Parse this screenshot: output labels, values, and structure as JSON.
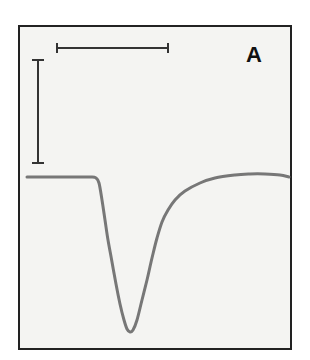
{
  "figure": {
    "panel_label": "A",
    "colors": {
      "background": "#f4f4f2",
      "frame": "#222222",
      "trace": "#777777",
      "scale_bar": "#333333"
    },
    "frame": {
      "x": 19,
      "y": 26,
      "width": 272,
      "height": 323
    },
    "scale_bars": {
      "horizontal": {
        "x1": 57,
        "x2": 168,
        "y": 48
      },
      "vertical": {
        "x": 38,
        "y1": 60,
        "y2": 163
      }
    }
  },
  "chart_data": {
    "type": "line",
    "title": "",
    "xlabel": "",
    "ylabel": "",
    "grid": false,
    "legend": null,
    "annotations": [
      "A"
    ],
    "series": [
      {
        "name": "trace",
        "points_px": [
          [
            27,
            177
          ],
          [
            60,
            177
          ],
          [
            90,
            177
          ],
          [
            96,
            178
          ],
          [
            99,
            183
          ],
          [
            102,
            200
          ],
          [
            105,
            220
          ],
          [
            108,
            240
          ],
          [
            112,
            262
          ],
          [
            116,
            284
          ],
          [
            120,
            304
          ],
          [
            124,
            320
          ],
          [
            127,
            329
          ],
          [
            130,
            332
          ],
          [
            133,
            330
          ],
          [
            137,
            320
          ],
          [
            142,
            300
          ],
          [
            147,
            280
          ],
          [
            152,
            258
          ],
          [
            157,
            238
          ],
          [
            162,
            222
          ],
          [
            168,
            210
          ],
          [
            175,
            200
          ],
          [
            185,
            191
          ],
          [
            200,
            183
          ],
          [
            215,
            178
          ],
          [
            235,
            175
          ],
          [
            250,
            174
          ],
          [
            265,
            174
          ],
          [
            280,
            175
          ],
          [
            289,
            177
          ]
        ]
      }
    ]
  }
}
